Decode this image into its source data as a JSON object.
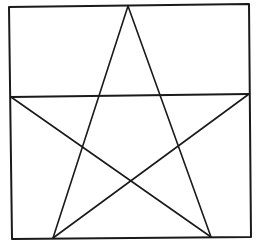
{
  "diagram": {
    "stroke_color": "#1a1a1a",
    "background_color": "#ffffff",
    "stroke_width": 2,
    "square": {
      "top_left": [
        9,
        7
      ],
      "top_right": [
        249,
        4
      ],
      "bottom_right": [
        251,
        237
      ],
      "bottom_left": [
        12,
        239
      ]
    },
    "horizontal_line": {
      "start": [
        11,
        97
      ],
      "end": [
        249,
        94
      ]
    },
    "star": {
      "apex": [
        128,
        6
      ],
      "left_point": [
        11,
        97
      ],
      "right_point": [
        249,
        94
      ],
      "bottom_left": [
        53,
        238
      ],
      "bottom_right": [
        211,
        237
      ]
    }
  }
}
